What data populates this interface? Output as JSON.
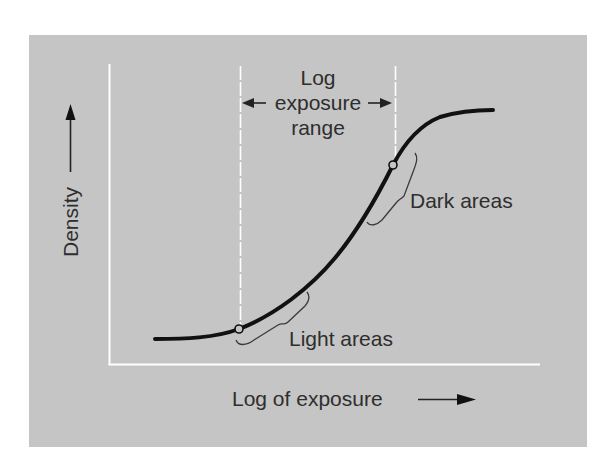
{
  "diagram": {
    "type": "characteristic-curve",
    "colors": {
      "panel": "#c5c5c5",
      "axis": "#ffffff",
      "curve": "#111111",
      "text": "#2e2e2e",
      "bracket": "#3a3a3a"
    },
    "y_axis": {
      "label": "Density",
      "arrow": "up-arrow"
    },
    "x_axis": {
      "label": "Log of exposure",
      "arrow": "right-arrow"
    },
    "range_annotation": {
      "line1": "Log",
      "line2": "exposure",
      "line3": "range"
    },
    "points": [
      {
        "name": "light-point",
        "label": "Light areas"
      },
      {
        "name": "dark-point",
        "label": "Dark areas"
      }
    ]
  }
}
